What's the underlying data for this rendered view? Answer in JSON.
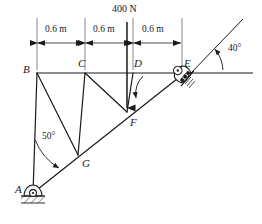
{
  "figure": {
    "stroke_color": "#1a1a1a",
    "background": "#ffffff"
  },
  "load": {
    "label": "400 N",
    "applied_at_joint": "D",
    "direction": "down"
  },
  "dimensions": {
    "unit_label": "m",
    "segments": [
      {
        "label": "0.6 m",
        "from": "B",
        "to": "C"
      },
      {
        "label": "0.6 m",
        "from": "C",
        "to": "D"
      },
      {
        "label": "0.6 m",
        "from": "D",
        "to": "E"
      }
    ]
  },
  "angles": [
    {
      "label": "50°",
      "at": "A",
      "between": "member AB and member AE"
    },
    {
      "label": "40°",
      "at": "E",
      "between": "horizontal reference and inclined support surface"
    }
  ],
  "joints": [
    {
      "name": "A",
      "label": "A",
      "x": 30,
      "y": 196,
      "support": "pin"
    },
    {
      "name": "B",
      "label": "B",
      "x": 37,
      "y": 73,
      "support": "none"
    },
    {
      "name": "C",
      "label": "C",
      "x": 85,
      "y": 73,
      "support": "none"
    },
    {
      "name": "D",
      "label": "D",
      "x": 133,
      "y": 73,
      "support": "none"
    },
    {
      "name": "E",
      "label": "E",
      "x": 182,
      "y": 73,
      "support": "inclined-roller"
    },
    {
      "name": "F",
      "label": "F",
      "x": 127,
      "y": 112,
      "support": "none"
    },
    {
      "name": "G",
      "label": "G",
      "x": 78,
      "y": 155,
      "support": "none"
    }
  ],
  "members": [
    {
      "from": "A",
      "to": "B"
    },
    {
      "from": "B",
      "to": "C"
    },
    {
      "from": "C",
      "to": "D"
    },
    {
      "from": "D",
      "to": "E"
    },
    {
      "from": "A",
      "to": "G"
    },
    {
      "from": "G",
      "to": "F"
    },
    {
      "from": "F",
      "to": "E"
    },
    {
      "from": "B",
      "to": "G"
    },
    {
      "from": "C",
      "to": "G"
    },
    {
      "from": "C",
      "to": "F"
    },
    {
      "from": "D",
      "to": "F"
    }
  ],
  "supports": {
    "pin_at_A": {
      "label": "A",
      "type": "pin-with-ground-hatch"
    },
    "roller_at_E": {
      "label": "E",
      "type": "inclined-roller-with-ground-hatch"
    }
  },
  "annotations": {
    "incline_pointer": "curved arrow from D toward member FE",
    "angle_pointer_50": "curved arrow at A between AB and AG",
    "angle_pointer_40": "arrow at E between horizontal and incline"
  }
}
